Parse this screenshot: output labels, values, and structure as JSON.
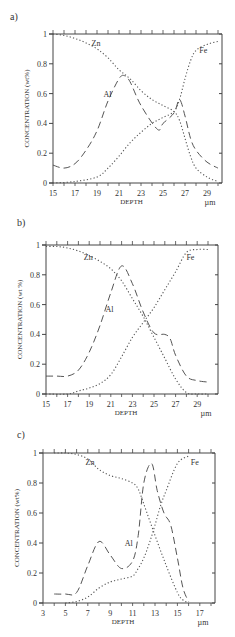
{
  "chart_data": [
    {
      "panel_label": "a)",
      "type": "line",
      "title": "",
      "xlabel": "DEPTH",
      "xunit": "µm",
      "ylabel": "CONCENTRATION (wt%)",
      "xlim": [
        15,
        30
      ],
      "ylim": [
        0,
        1
      ],
      "xticks": [
        15,
        17,
        19,
        21,
        23,
        25,
        27,
        29
      ],
      "yticks": [
        0,
        0.2,
        0.4,
        0.6,
        0.8,
        1
      ],
      "ytick_labels": [
        "0",
        "0.2",
        "0.4",
        "0.6",
        "0.8",
        "1"
      ],
      "grid": false,
      "series": [
        {
          "name": "Zn",
          "style": "dotted",
          "x": [
            15,
            16,
            17,
            18,
            19,
            20,
            21,
            22,
            23,
            24,
            25,
            26,
            26.5,
            27,
            27.5,
            28,
            29,
            30
          ],
          "y": [
            1.0,
            0.99,
            0.97,
            0.94,
            0.9,
            0.84,
            0.76,
            0.7,
            0.62,
            0.56,
            0.52,
            0.48,
            0.42,
            0.3,
            0.18,
            0.1,
            0.04,
            0.01
          ]
        },
        {
          "name": "Al",
          "style": "dashed",
          "x": [
            15,
            16,
            17,
            18,
            19,
            20,
            21,
            21.5,
            22,
            23,
            24.5,
            25,
            26,
            26.5,
            27,
            27.5,
            28,
            29,
            30
          ],
          "y": [
            0.12,
            0.1,
            0.13,
            0.22,
            0.35,
            0.55,
            0.7,
            0.72,
            0.68,
            0.52,
            0.36,
            0.4,
            0.47,
            0.56,
            0.45,
            0.3,
            0.22,
            0.14,
            0.1
          ]
        },
        {
          "name": "Fe",
          "style": "dotted",
          "x": [
            15,
            17,
            19,
            20,
            21,
            22,
            23,
            24,
            25,
            26,
            26.5,
            27,
            27.5,
            28,
            29,
            30
          ],
          "y": [
            0.0,
            0.01,
            0.04,
            0.1,
            0.18,
            0.27,
            0.34,
            0.4,
            0.44,
            0.48,
            0.56,
            0.7,
            0.82,
            0.89,
            0.93,
            0.95
          ]
        }
      ],
      "annotations": [
        {
          "text": "Zn",
          "x": 18.5,
          "y": 0.92
        },
        {
          "text": "Al",
          "x": 19.6,
          "y": 0.58
        },
        {
          "text": "Fe",
          "x": 28.3,
          "y": 0.87
        }
      ]
    },
    {
      "panel_label": "b)",
      "type": "line",
      "title": "",
      "xlabel": "DEPTH",
      "xunit": "µm",
      "ylabel": "CONCENTRATION (wt %)",
      "xlim": [
        15,
        30
      ],
      "ylim": [
        0,
        1
      ],
      "xticks": [
        15,
        17,
        19,
        21,
        23,
        25,
        27,
        29
      ],
      "yticks": [
        0,
        0.2,
        0.4,
        0.6,
        0.8,
        1
      ],
      "ytick_labels": [
        "0",
        "0.2",
        "0.4",
        "0.6",
        "0.8",
        "1"
      ],
      "grid": false,
      "series": [
        {
          "name": "Zn",
          "style": "dotted",
          "x": [
            15,
            16,
            17,
            18,
            19,
            20,
            21,
            22,
            23,
            24,
            25,
            26,
            27,
            28,
            29,
            30
          ],
          "y": [
            0.99,
            0.99,
            0.98,
            0.96,
            0.93,
            0.89,
            0.84,
            0.76,
            0.64,
            0.52,
            0.38,
            0.24,
            0.1,
            0.01,
            0.0,
            0.0
          ]
        },
        {
          "name": "Al",
          "style": "dashed",
          "x": [
            15,
            16,
            17,
            18,
            19,
            20,
            21,
            22,
            23,
            24,
            25,
            26,
            26.5,
            27,
            28,
            29,
            30
          ],
          "y": [
            0.12,
            0.12,
            0.12,
            0.16,
            0.28,
            0.46,
            0.68,
            0.86,
            0.74,
            0.55,
            0.41,
            0.4,
            0.37,
            0.26,
            0.12,
            0.09,
            0.08
          ]
        },
        {
          "name": "Fe",
          "style": "dotted",
          "x": [
            15,
            17,
            18,
            19,
            20,
            21,
            22,
            23,
            24,
            25,
            26,
            27,
            28,
            29,
            30
          ],
          "y": [
            0.0,
            0.0,
            0.02,
            0.04,
            0.07,
            0.13,
            0.25,
            0.38,
            0.48,
            0.58,
            0.7,
            0.82,
            0.95,
            0.97,
            0.97
          ]
        }
      ],
      "annotations": [
        {
          "text": "Zn",
          "x": 18.5,
          "y": 0.9
        },
        {
          "text": "Al",
          "x": 20.5,
          "y": 0.55
        },
        {
          "text": "Fe",
          "x": 28,
          "y": 0.9
        }
      ]
    },
    {
      "panel_label": "c)",
      "type": "line",
      "title": "",
      "xlabel": "DEPTH",
      "xunit": "µm",
      "ylabel": "CONCENTRATION (wt%)",
      "xlim": [
        3,
        18
      ],
      "ylim": [
        0,
        1
      ],
      "xticks": [
        3,
        5,
        7,
        9,
        11,
        13,
        15,
        17
      ],
      "yticks": [
        0,
        0.2,
        0.4,
        0.6,
        0.8,
        1
      ],
      "ytick_labels": [
        "0",
        "0.2",
        "0.4",
        "0.6",
        "0.8",
        "1"
      ],
      "grid": false,
      "series": [
        {
          "name": "Zn",
          "style": "dotted",
          "x": [
            4,
            5,
            6,
            7,
            8,
            9,
            10,
            11,
            11.5,
            12,
            13,
            14,
            15,
            15.5,
            16
          ],
          "y": [
            1.0,
            1.0,
            0.99,
            0.96,
            0.89,
            0.85,
            0.83,
            0.8,
            0.76,
            0.66,
            0.45,
            0.25,
            0.07,
            0.02,
            0.0
          ]
        },
        {
          "name": "Al",
          "style": "dashed",
          "x": [
            4,
            5,
            6,
            7,
            8,
            9,
            10,
            11,
            11.5,
            12,
            12.7,
            13.2,
            13.8,
            14.4,
            15,
            15.5,
            16
          ],
          "y": [
            0.06,
            0.06,
            0.07,
            0.25,
            0.41,
            0.32,
            0.23,
            0.28,
            0.45,
            0.8,
            0.93,
            0.75,
            0.6,
            0.52,
            0.3,
            0.1,
            0.01
          ]
        },
        {
          "name": "Fe",
          "style": "dotted",
          "x": [
            5,
            6,
            7,
            8,
            9,
            10,
            11,
            11.5,
            12,
            12.5,
            13,
            13.5,
            14,
            15,
            16
          ],
          "y": [
            0.0,
            0.01,
            0.04,
            0.1,
            0.14,
            0.16,
            0.18,
            0.23,
            0.3,
            0.4,
            0.52,
            0.65,
            0.75,
            0.93,
            0.98
          ]
        }
      ],
      "annotations": [
        {
          "text": "Zn",
          "x": 6.8,
          "y": 0.92
        },
        {
          "text": "Al",
          "x": 10.3,
          "y": 0.38
        },
        {
          "text": "Fe",
          "x": 16.2,
          "y": 0.92
        }
      ]
    }
  ]
}
